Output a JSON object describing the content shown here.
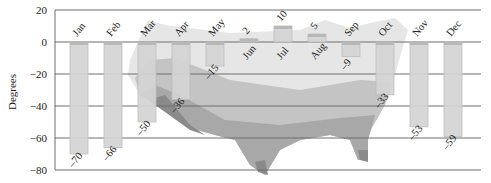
{
  "chart_data": {
    "type": "bar",
    "title": "",
    "xlabel": "",
    "ylabel": "Degrees",
    "ylim": [
      -80,
      20
    ],
    "yticks": [
      20,
      0,
      -20,
      -40,
      -60,
      -80
    ],
    "grid": true,
    "background": "shaded map of the contiguous United States",
    "categories": [
      "Jan",
      "Feb",
      "Mar",
      "Apr",
      "May",
      "Jun",
      "Jul",
      "Aug",
      "Sep",
      "Oct",
      "Nov",
      "Dec"
    ],
    "values": [
      -70,
      -66,
      -50,
      -36,
      -15,
      2,
      10,
      5,
      -9,
      -33,
      -53,
      -59
    ],
    "value_labels": [
      "–70",
      "–66",
      "–50",
      "–36",
      "–15",
      "2",
      "10",
      "5",
      "–9",
      "–33",
      "–53",
      "–59"
    ],
    "colors": {
      "bar": "#d4d4d4",
      "bar_edge": "#bdbdbd",
      "grid": "#6e6e6e",
      "map_light": "#e6e6e6",
      "map_mid": "#c4c4c4",
      "map_dark": "#a3a3a3",
      "map_darkest": "#8a8a8a"
    }
  }
}
